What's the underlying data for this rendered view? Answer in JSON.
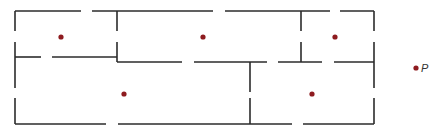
{
  "diagram": {
    "type": "floor-plan",
    "colors": {
      "wall": "#2b2b2b",
      "point": "#8e1b1f",
      "label": "#333333"
    },
    "rooms": [
      {
        "id": "room-top-left"
      },
      {
        "id": "room-top-middle"
      },
      {
        "id": "room-top-right"
      },
      {
        "id": "room-bottom-left"
      },
      {
        "id": "room-bottom-right"
      }
    ],
    "external_point": {
      "label": "P"
    }
  }
}
